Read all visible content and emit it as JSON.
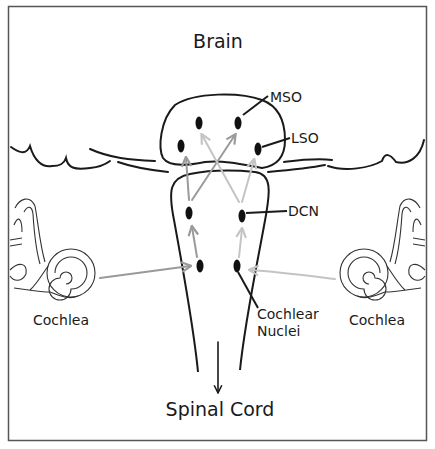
{
  "title": "Brain",
  "labels": {
    "mso": "MSO",
    "lso": "LSO",
    "dcn": "DCN",
    "cochlear_nuclei_line1": "Cochlear",
    "cochlear_nuclei_line2": "Nuclei",
    "cochlea_left": "Cochlea",
    "cochlea_right": "Cochlea",
    "spinal_cord": "Spinal Cord"
  },
  "colors": {
    "ink": "#1a1a1a",
    "arrow_gray": "#9a9a9a",
    "arrow_light": "#c4c4c4",
    "frame": "#555555",
    "background": "#ffffff"
  }
}
